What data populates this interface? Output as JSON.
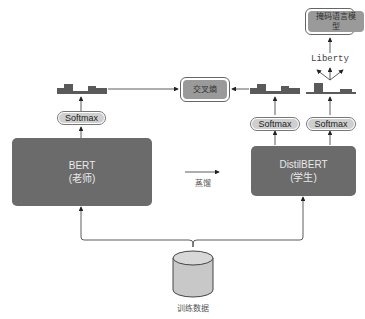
{
  "diagram": {
    "teacher": {
      "name": "BERT",
      "role": "(老师)"
    },
    "student": {
      "name": "DistilBERT",
      "role": "(学生)"
    },
    "softmax_label": "Softmax",
    "cross_entropy": "交叉熵",
    "mlm": "掩码语言模型",
    "token": "Liberty",
    "distill_label": "蒸馏",
    "data_label": "训练数据"
  },
  "colors": {
    "model_box": "#6b6b6b",
    "softmax_fill": "#cfcfcf",
    "loss_box": "#9a9a9a",
    "histogram": "#5a5a5a",
    "cylinder": "#c8c8c8"
  }
}
